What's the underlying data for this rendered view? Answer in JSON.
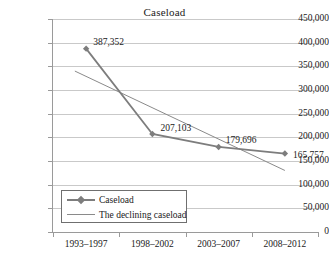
{
  "chart_data": {
    "type": "line",
    "title": "Caseload",
    "xlabel": "",
    "ylabel": "",
    "categories": [
      "1993–1997",
      "1998–2002",
      "2003–2007",
      "2008–2012"
    ],
    "ylim": [
      0,
      450000
    ],
    "ytick_step": 50000,
    "ytick_labels": [
      "450,000",
      "400,000",
      "350,000",
      "300,000",
      "250,000",
      "200,000",
      "150,000",
      "100,000",
      "50,000",
      "0"
    ],
    "ytick_values": [
      450000,
      400000,
      350000,
      300000,
      250000,
      200000,
      150000,
      100000,
      50000,
      0
    ],
    "grid": true,
    "legend_position": "inside-bottom-left",
    "series": [
      {
        "name": "Caseload",
        "type": "line-marker",
        "color": "#7d7d7d",
        "marker": "diamond",
        "values": [
          387352,
          207103,
          179696,
          165757
        ],
        "data_labels": [
          "387,352",
          "207,103",
          "179,696",
          "165,757"
        ]
      },
      {
        "name": "The declining caseload",
        "type": "trendline",
        "color": "#8a8a8a",
        "marker": "none",
        "endpoints": [
          340000,
          130000
        ]
      }
    ]
  },
  "legend": {
    "items": [
      {
        "label": "Caseload"
      },
      {
        "label": "The declining caseload"
      }
    ]
  },
  "colors": {
    "series_line": "#7d7d7d",
    "trend_line": "#8a8a8a",
    "gridline": "#c9c9c9",
    "axis": "#9a9a9a",
    "text": "#1a1a1a",
    "background": "#ffffff"
  }
}
